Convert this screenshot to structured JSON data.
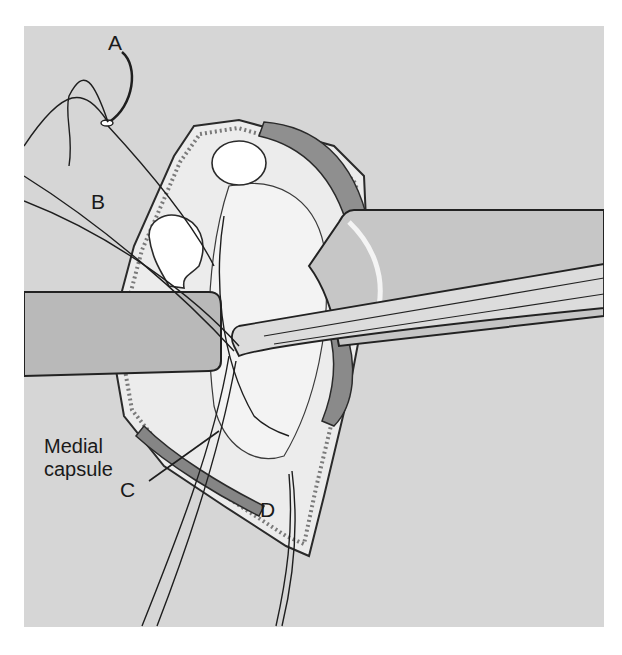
{
  "figure": {
    "labels": {
      "a": "A",
      "b": "B",
      "c": "C",
      "d": "D",
      "medial_capsule_line1": "Medial",
      "medial_capsule_line2": "capsule"
    },
    "colors": {
      "background": "#d6d6d6",
      "tissue_light": "#efefef",
      "retractor": "#bdbdbd",
      "muscle": "#8a8a8a",
      "outline": "#1e1e1e",
      "bone": "#ffffff"
    }
  }
}
